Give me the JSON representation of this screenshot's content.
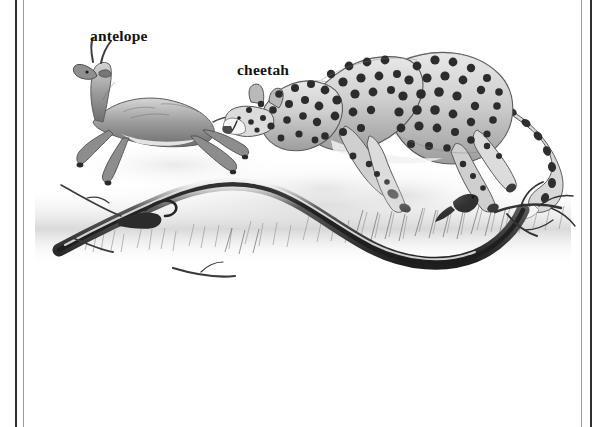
{
  "page": {
    "kind": "scanned-book-figure",
    "background_color": "#ffffff",
    "frame": {
      "outer_rule_color": "#2e2e2e",
      "inner_rule_color": "#9a9a9a",
      "rule_count": 4,
      "orientation": "vertical"
    }
  },
  "figure": {
    "medium": "grayscale pencil and ink illustration",
    "scene_description": "A cheetah bounding at full stride in pursuit of a leaping antelope across dry grassland with a fallen branch in the foreground",
    "labels": [
      {
        "id": "antelope",
        "text": "antelope",
        "x": 90,
        "y": 27
      },
      {
        "id": "cheetah",
        "text": "cheetah",
        "x": 237,
        "y": 61
      }
    ],
    "subjects": [
      {
        "name": "antelope",
        "pose": "leaping, all four legs extended",
        "tone": "mid gray with white belly",
        "bbox": [
          62,
          48,
          142,
          172
        ]
      },
      {
        "name": "cheetah",
        "pose": "galloping bound, back arched, tail trailing",
        "coat": "spotted with ringed tail tip",
        "tone": "light gray with dark spots",
        "bbox": [
          226,
          40,
          545,
          210
        ]
      },
      {
        "name": "fallen-branch",
        "pose": "sinuous dead log lying across the foreground",
        "tone": "dark gray ink",
        "bbox": [
          32,
          178,
          560,
          285
        ]
      },
      {
        "name": "bird",
        "pose": "small bird perched near the branch",
        "tone": "dark gray",
        "bbox": [
          448,
          198,
          472,
          218
        ]
      },
      {
        "name": "grass",
        "pose": "ground hatching and tufts beneath the animals",
        "tone": "light gray wash",
        "bbox": [
          32,
          150,
          560,
          280
        ]
      }
    ],
    "top_caption_sliver": "",
    "palette": {
      "paper": "#ffffff",
      "ink_dark": "#2b2b2b",
      "ink_mid": "#707070",
      "ink_light": "#b8b8b8",
      "wash": "#dcdcdc",
      "label_text": "#141414"
    }
  }
}
